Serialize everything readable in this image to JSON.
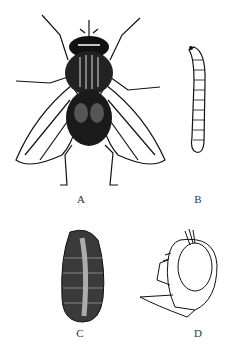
{
  "figure": {
    "panels": [
      {
        "id": "A",
        "label": "A",
        "subject": "adult fly, dorsal view"
      },
      {
        "id": "B",
        "label": "B",
        "subject": "larva (maggot)"
      },
      {
        "id": "C",
        "label": "C",
        "subject": "pupa (puparium)"
      },
      {
        "id": "D",
        "label": "D",
        "subject": "adult head, lateral view"
      }
    ],
    "colors": {
      "ink": "#111111",
      "background": "#ffffff"
    }
  }
}
